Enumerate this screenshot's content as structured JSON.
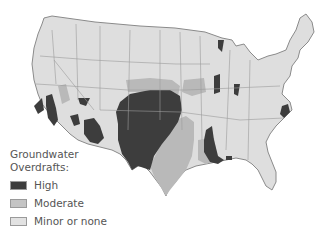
{
  "map": {
    "subject": "Contiguous United States",
    "colors": {
      "high": "#3d3d3d",
      "moderate": "#b9b9b9",
      "minor": "#dedede",
      "border": "#8a8a8a",
      "background": "#ffffff"
    }
  },
  "legend": {
    "title_line1": "Groundwater",
    "title_line2": "Overdrafts:",
    "items": [
      {
        "label": "High",
        "color": "#3d3d3d"
      },
      {
        "label": "Moderate",
        "color": "#c4c4c4"
      },
      {
        "label": "Minor or none",
        "color": "#e2e2e2"
      }
    ]
  }
}
